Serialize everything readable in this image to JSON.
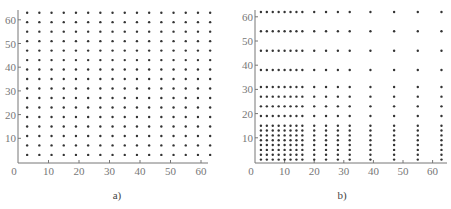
{
  "top_caption_fragment": "",
  "chart_data": [
    {
      "type": "scatter",
      "panel": "a)",
      "title": "",
      "xlabel": "",
      "ylabel": "",
      "xlim": [
        0,
        64
      ],
      "ylim": [
        0,
        64
      ],
      "xticks": [
        0,
        10,
        20,
        30,
        40,
        50,
        60
      ],
      "yticks": [
        10,
        20,
        30,
        40,
        50,
        60
      ],
      "grid": false,
      "description": "Uniform 16x16 grid of points",
      "x_levels": [
        3,
        7,
        11,
        15,
        19,
        23,
        27,
        31,
        35,
        39,
        43,
        47,
        51,
        55,
        59,
        63
      ],
      "y_levels": [
        3,
        7,
        11,
        15,
        19,
        23,
        27,
        31,
        35,
        39,
        43,
        47,
        51,
        55,
        59,
        63
      ]
    },
    {
      "type": "scatter",
      "panel": "b)",
      "title": "",
      "xlabel": "",
      "ylabel": "",
      "xlim": [
        0,
        64
      ],
      "ylim": [
        0,
        64
      ],
      "xticks": [
        0,
        10,
        20,
        30,
        40,
        50,
        60
      ],
      "yticks": [
        10,
        20,
        30,
        40,
        50,
        60
      ],
      "grid": false,
      "description": "Non-uniform 16x16 grid of points, dense near origin",
      "x_levels": [
        2,
        4,
        6,
        8,
        10,
        12,
        14,
        16,
        20,
        24,
        28,
        32,
        39,
        47,
        55,
        63
      ],
      "y_levels": [
        1,
        3,
        5,
        7,
        9,
        11,
        13,
        15,
        19,
        23,
        27,
        31,
        38,
        46,
        54,
        62
      ]
    }
  ],
  "colors": {
    "dot": "#333333",
    "axis": "#777777"
  }
}
